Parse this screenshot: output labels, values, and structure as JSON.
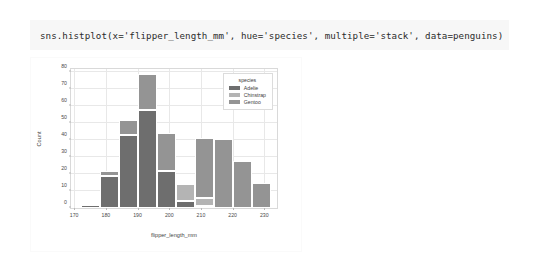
{
  "cell": {
    "code": "sns.histplot(x='flipper_length_mm', hue='species', multiple='stack', data=penguins)"
  },
  "chart_data": {
    "type": "bar",
    "title": "",
    "subtitle": "",
    "xlabel": "flipper_length_mm",
    "ylabel": "Count",
    "xlim": [
      169,
      234
    ],
    "ylim": [
      0,
      82
    ],
    "xticks": [
      170,
      180,
      190,
      200,
      210,
      220,
      230
    ],
    "yticks": [
      0,
      10,
      20,
      30,
      40,
      50,
      60,
      70,
      80
    ],
    "grid": true,
    "stacked": true,
    "legend": {
      "position": "upper right",
      "title": "species",
      "entries": [
        {
          "label": "Adelie",
          "color": "#6e6e6e"
        },
        {
          "label": "Chinstrap",
          "color": "#b4b4b4"
        },
        {
          "label": "Gentoo",
          "color": "#949494"
        }
      ]
    },
    "bin_edges": [
      172,
      178,
      184,
      190,
      196,
      202,
      208,
      214,
      220,
      226,
      232
    ],
    "bin_centers": [
      175,
      181,
      187,
      193,
      199,
      205,
      211,
      217,
      223,
      229
    ],
    "series": [
      {
        "name": "Adelie",
        "color": "#6e6e6e",
        "values": [
          2,
          19,
          43,
          58,
          22,
          4,
          1,
          0,
          0,
          0
        ]
      },
      {
        "name": "Chinstrap",
        "color": "#b4b4b4",
        "values": [
          0,
          0,
          0,
          0,
          0,
          10,
          5,
          0,
          0,
          0
        ]
      },
      {
        "name": "Gentoo",
        "color": "#949494",
        "values": [
          0,
          3,
          9,
          21,
          22,
          1,
          35,
          41,
          28,
          15
        ]
      }
    ],
    "totals": [
      2,
      22,
      52,
      79,
      44,
      15,
      41,
      41,
      28,
      15
    ]
  },
  "figure": {
    "background": "#ffffff",
    "axes_edge_color": "#d9d9d9",
    "grid_color": "#e8e8e8",
    "tick_label_color": "#4a4a4a"
  }
}
